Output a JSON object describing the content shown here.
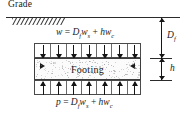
{
  "diagram": {
    "grade_label": "Grade",
    "body_label": "Footing",
    "equations": {
      "top": {
        "lhs": "w",
        "eq": "=",
        "term1_var": "D",
        "term1_sub": "f",
        "term1_w": "w",
        "term1_wsub": "s",
        "plus": "+",
        "term2_h": "h",
        "term2_w": "w",
        "term2_wsub": "c",
        "full": "w = D_f w_s + h w_c"
      },
      "bottom": {
        "lhs": "p",
        "eq": "=",
        "term1_var": "D",
        "term1_sub": "f",
        "term1_w": "w",
        "term1_wsub": "s",
        "plus": "+",
        "term2_h": "h",
        "term2_w": "w",
        "term2_wsub": "c",
        "full": "p = D_f w_s + h w_c"
      }
    },
    "dimensions": {
      "depth_label": "D",
      "depth_sub": "f",
      "thickness_label": "h"
    },
    "colors": {
      "line": "#2b2b2b",
      "arrow": "#161616",
      "fill": "#fbfbfb",
      "speck": "#8d8d8d",
      "background": "#ffffff"
    },
    "counts": {
      "top_arrows": 7,
      "bottom_arrows": 7,
      "hatch_marks": 14
    }
  }
}
